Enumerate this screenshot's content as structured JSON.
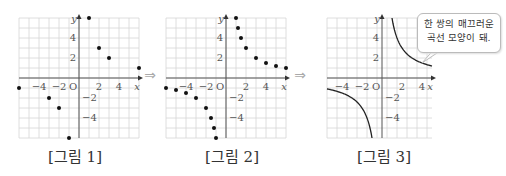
{
  "figures": [
    {
      "caption": "[그림 1]",
      "type": "points",
      "points": [
        [
          1,
          6
        ],
        [
          2,
          3
        ],
        [
          3,
          2
        ],
        [
          6,
          1
        ],
        [
          -1,
          -6
        ],
        [
          -2,
          -3
        ],
        [
          -3,
          -2
        ],
        [
          -6,
          -1
        ]
      ]
    },
    {
      "caption": "[그림 2]",
      "type": "points",
      "points": [
        [
          1,
          6
        ],
        [
          1.2,
          5
        ],
        [
          1.5,
          4
        ],
        [
          2,
          3
        ],
        [
          3,
          2
        ],
        [
          4,
          1.5
        ],
        [
          5,
          1.2
        ],
        [
          6,
          1
        ],
        [
          -1,
          -6
        ],
        [
          -1.2,
          -5
        ],
        [
          -1.5,
          -4
        ],
        [
          -2,
          -3
        ],
        [
          -3,
          -2
        ],
        [
          -4,
          -1.5
        ],
        [
          -5,
          -1.2
        ],
        [
          -6,
          -1
        ]
      ]
    },
    {
      "caption": "[그림 3]",
      "type": "curve",
      "function": "y=6/x"
    }
  ],
  "axis": {
    "x_label": "x",
    "y_label": "y",
    "origin": "O",
    "x_ticks": [
      "−4",
      "−2",
      "2",
      "4"
    ],
    "y_ticks": [
      "4",
      "2",
      "−2",
      "−4"
    ]
  },
  "bubble": {
    "line1": "한 쌍의 매끄러운",
    "line2": "곡선 모양이 돼."
  },
  "arrow": "⇒"
}
